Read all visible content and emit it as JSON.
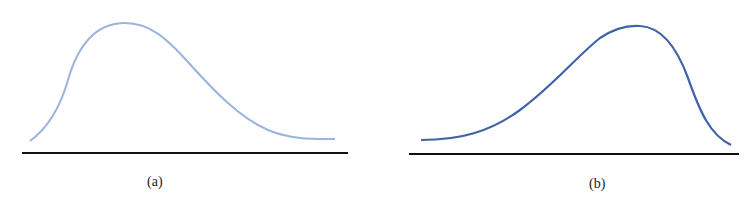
{
  "panels": [
    {
      "label": "(a)",
      "description": "right-skewed (positively skewed) distribution curve",
      "curve_color": "#9ab4dd",
      "baseline_color": "#111111"
    },
    {
      "label": "(b)",
      "description": "left-skewed (negatively skewed) distribution curve",
      "curve_color": "#3f63a8",
      "baseline_color": "#111111"
    }
  ]
}
